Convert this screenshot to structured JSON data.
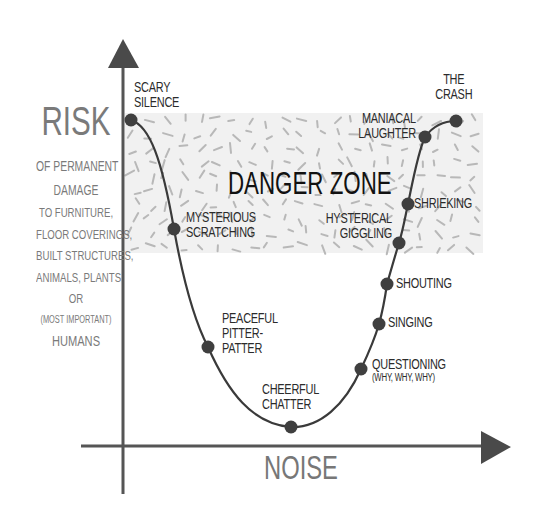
{
  "diagram": {
    "y_axis": {
      "title": "RISK",
      "subtitle_lines": [
        {
          "text": "OF PERMANENT",
          "size": 14
        },
        {
          "text": "DAMAGE",
          "size": 14
        },
        {
          "text": "TO FURNITURE,",
          "size": 13
        },
        {
          "text": "FLOOR COVERINGS,",
          "size": 13
        },
        {
          "text": "BUILT STRUCTURES,",
          "size": 13
        },
        {
          "text": "ANIMALS, PLANTS",
          "size": 13
        },
        {
          "text": "OR",
          "size": 13
        },
        {
          "text": "(MOST IMPORTANT)",
          "size": 10
        },
        {
          "text": "HUMANS",
          "size": 15
        }
      ]
    },
    "x_axis": {
      "title": "NOISE"
    },
    "danger_zone": {
      "label": "DANGER ZONE",
      "fill": "#f1f1f1",
      "dash_color": "#b8b8b8",
      "box": {
        "x": 125,
        "y": 113,
        "w": 358,
        "h": 140
      }
    },
    "colors": {
      "axis": "#555555",
      "curve": "#3a3a3a",
      "dot": "#3f3f3f",
      "label_text": "#2b2b2b",
      "axis_title": "#777777"
    },
    "points": [
      {
        "id": "scary-silence",
        "lines": [
          "SCARY",
          "SILENCE"
        ],
        "x": 131,
        "y": 120,
        "label_x": 134,
        "label_y": 80,
        "small": null
      },
      {
        "id": "mysterious-scratching",
        "lines": [
          "MYSTERIOUS",
          "SCRATCHING"
        ],
        "x": 174,
        "y": 229,
        "label_x": 186,
        "label_y": 210,
        "small": null
      },
      {
        "id": "peaceful-pitter-patter",
        "lines": [
          "PEACEFUL",
          "PITTER-",
          "PATTER"
        ],
        "x": 208,
        "y": 347,
        "label_x": 222,
        "label_y": 311,
        "small": null
      },
      {
        "id": "cheerful-chatter",
        "lines": [
          "CHEERFUL",
          "CHATTER"
        ],
        "x": 291,
        "y": 427,
        "label_x": 262,
        "label_y": 382,
        "small": null
      },
      {
        "id": "questioning",
        "lines": [
          "QUESTIONING"
        ],
        "x": 361,
        "y": 369,
        "label_x": 372,
        "label_y": 357,
        "small": "(WHY, WHY, WHY)"
      },
      {
        "id": "singing",
        "lines": [
          "SINGING"
        ],
        "x": 379,
        "y": 324,
        "label_x": 388,
        "label_y": 315,
        "small": null
      },
      {
        "id": "shouting",
        "lines": [
          "SHOUTING"
        ],
        "x": 387,
        "y": 284,
        "label_x": 396,
        "label_y": 276,
        "small": null
      },
      {
        "id": "hysterical-giggling",
        "lines": [
          "HYSTERICAL",
          "GIGGLING"
        ],
        "x": 399,
        "y": 243,
        "label_x": 318,
        "label_y": 211,
        "small": null,
        "align": "right",
        "right_edge": 392
      },
      {
        "id": "shrieking",
        "lines": [
          "SHRIEKING"
        ],
        "x": 408,
        "y": 204,
        "label_x": 414,
        "label_y": 196,
        "small": null
      },
      {
        "id": "maniacal-laughter",
        "lines": [
          "MANIACAL",
          "LAUGHTER"
        ],
        "x": 425,
        "y": 137,
        "label_x": 350,
        "label_y": 111,
        "small": null,
        "align": "right",
        "right_edge": 416
      },
      {
        "id": "the-crash",
        "lines": [
          "THE",
          "CRASH"
        ],
        "x": 456,
        "y": 121,
        "label_x": 433,
        "label_y": 72,
        "small": null,
        "align": "center",
        "center_x": 454
      }
    ]
  }
}
